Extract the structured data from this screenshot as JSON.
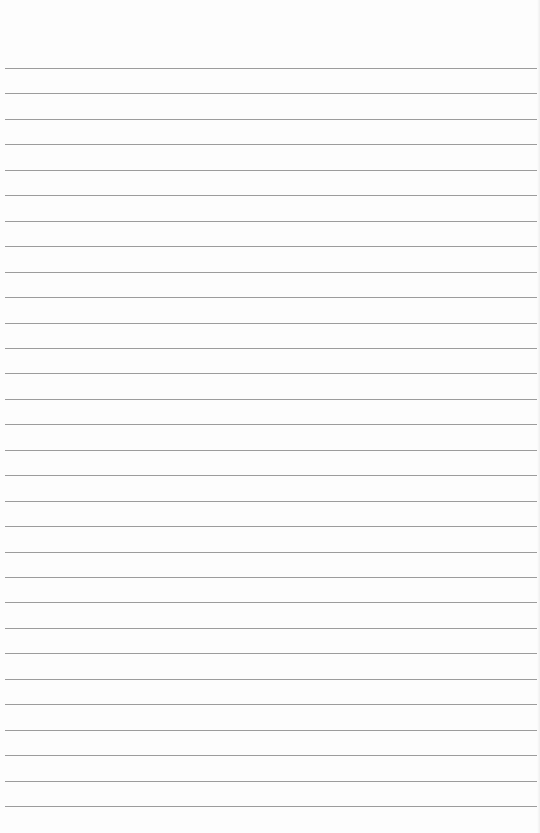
{
  "page": {
    "type": "lined-paper",
    "background_color": "#fdfdfd",
    "line_color": "#9c9c9c",
    "line_count": 30,
    "first_line_y": 68,
    "line_spacing": 25.45,
    "line_left": 5,
    "line_right": 537
  }
}
